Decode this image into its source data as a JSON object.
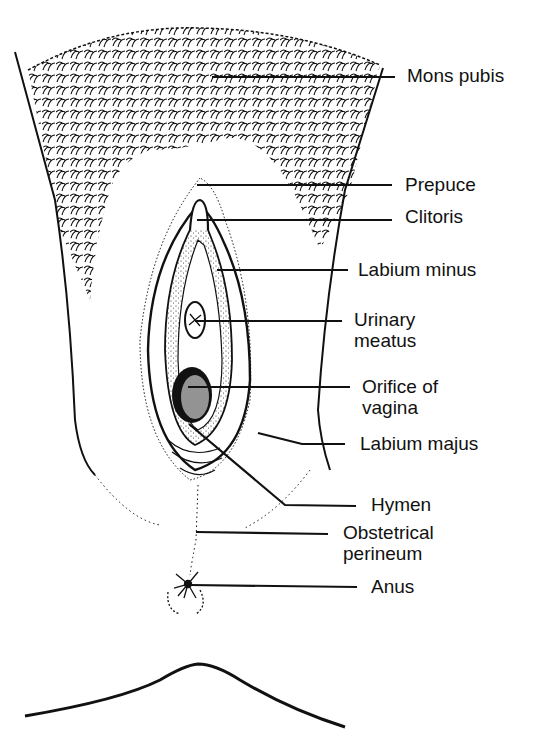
{
  "diagram": {
    "colors": {
      "ink": "#111111",
      "background": "#ffffff"
    },
    "labels": [
      {
        "id": "mons-pubis",
        "line1": "Mons pubis",
        "line2": ""
      },
      {
        "id": "prepuce",
        "line1": "Prepuce",
        "line2": ""
      },
      {
        "id": "clitoris",
        "line1": "Clitoris",
        "line2": ""
      },
      {
        "id": "labium-minus",
        "line1": "Labium minus",
        "line2": ""
      },
      {
        "id": "urinary-meatus",
        "line1": "Urinary",
        "line2": "meatus"
      },
      {
        "id": "orifice-of-vagina",
        "line1": "Orifice of",
        "line2": "vagina"
      },
      {
        "id": "labium-majus",
        "line1": "Labium majus",
        "line2": ""
      },
      {
        "id": "hymen",
        "line1": "Hymen",
        "line2": ""
      },
      {
        "id": "obstetrical-perineum",
        "line1": "Obstetrical",
        "line2": "perineum"
      },
      {
        "id": "anus",
        "line1": "Anus",
        "line2": ""
      }
    ]
  }
}
